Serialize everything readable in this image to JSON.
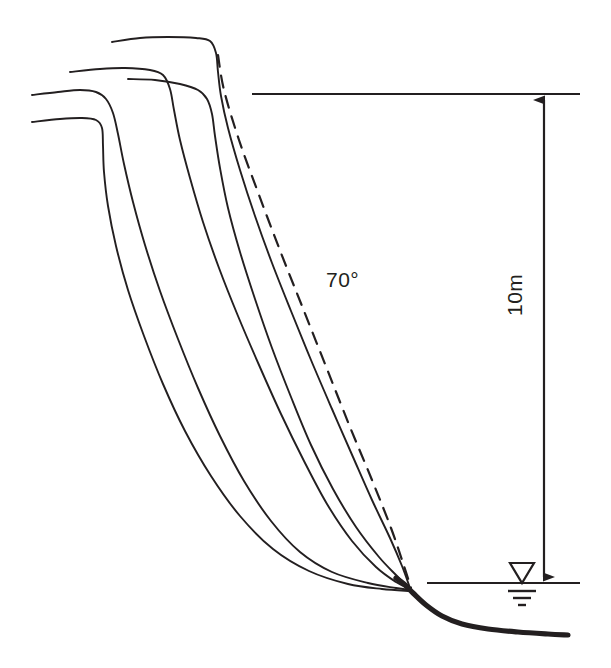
{
  "figure": {
    "background_color": "#ffffff",
    "line_color": "#231f20",
    "width": 611,
    "height": 668
  },
  "annotations": {
    "angle_label": "70°",
    "depth_label": "10m"
  },
  "symbols": {
    "water_table": "water-table-symbol",
    "dimension_arrow": "double-headed-vertical-arrow"
  },
  "chart_data": {
    "type": "line",
    "xlabel": "",
    "ylabel": "",
    "grid": false,
    "legend": "none",
    "annotations": [
      {
        "text": "70°",
        "x": 328,
        "y": 280,
        "role": "slope-angle-of-dashed-reference-line"
      },
      {
        "text": "10m",
        "x": 513,
        "y": 350,
        "role": "vertical-dimension-between-crest-and-water-table",
        "rotation": -90
      }
    ],
    "reference_lines": [
      {
        "name": "crest-level-line",
        "type": "horizontal-solid",
        "y": 94,
        "x_start": 252,
        "x_end": 580
      },
      {
        "name": "water-table-level-line",
        "type": "horizontal-solid",
        "y": 583,
        "x_start": 427,
        "x_end": 580
      },
      {
        "name": "dimension-arrow-10m",
        "type": "vertical-double-arrow",
        "x": 544,
        "y_top": 94,
        "y_bottom": 583
      }
    ],
    "series": [
      {
        "name": "reference-slope-70deg",
        "style": "dashed",
        "points": [
          [
            218,
            55
          ],
          [
            224,
            90
          ],
          [
            239,
            140
          ],
          [
            259,
            195
          ],
          [
            281,
            253
          ],
          [
            304,
            311
          ],
          [
            327,
            369
          ],
          [
            350,
            427
          ],
          [
            372,
            480
          ],
          [
            391,
            528
          ],
          [
            404,
            566
          ],
          [
            411,
            588
          ]
        ]
      },
      {
        "name": "deflection-profile-1",
        "style": "solid",
        "points": [
          [
            112,
            42
          ],
          [
            140,
            38
          ],
          [
            168,
            37
          ],
          [
            196,
            38
          ],
          [
            210,
            41
          ],
          [
            216,
            53
          ],
          [
            218,
            72
          ],
          [
            221,
            96
          ],
          [
            228,
            128
          ],
          [
            240,
            170
          ],
          [
            255,
            216
          ],
          [
            272,
            263
          ],
          [
            291,
            311
          ],
          [
            311,
            360
          ],
          [
            332,
            409
          ],
          [
            353,
            457
          ],
          [
            372,
            500
          ],
          [
            390,
            538
          ],
          [
            402,
            566
          ],
          [
            410,
            588
          ]
        ]
      },
      {
        "name": "deflection-profile-2",
        "style": "solid",
        "points": [
          [
            70,
            72
          ],
          [
            100,
            69
          ],
          [
            125,
            68
          ],
          [
            150,
            70
          ],
          [
            163,
            75
          ],
          [
            170,
            89
          ],
          [
            174,
            110
          ],
          [
            180,
            140
          ],
          [
            190,
            178
          ],
          [
            203,
            222
          ],
          [
            219,
            268
          ],
          [
            238,
            316
          ],
          [
            259,
            365
          ],
          [
            281,
            414
          ],
          [
            304,
            461
          ],
          [
            327,
            504
          ],
          [
            352,
            541
          ],
          [
            376,
            567
          ],
          [
            396,
            582
          ],
          [
            410,
            589
          ]
        ]
      },
      {
        "name": "deflection-profile-3",
        "style": "solid",
        "points": [
          [
            128,
            79
          ],
          [
            155,
            80
          ],
          [
            180,
            84
          ],
          [
            198,
            90
          ],
          [
            207,
            99
          ],
          [
            212,
            114
          ],
          [
            215,
            136
          ],
          [
            220,
            168
          ],
          [
            228,
            208
          ],
          [
            240,
            252
          ],
          [
            255,
            299
          ],
          [
            272,
            348
          ],
          [
            291,
            397
          ],
          [
            311,
            445
          ],
          [
            333,
            489
          ],
          [
            356,
            527
          ],
          [
            379,
            557
          ],
          [
            397,
            576
          ],
          [
            410,
            589
          ]
        ]
      },
      {
        "name": "deflection-profile-4",
        "style": "solid",
        "points": [
          [
            32,
            95
          ],
          [
            58,
            92
          ],
          [
            80,
            90
          ],
          [
            96,
            92
          ],
          [
            106,
            99
          ],
          [
            113,
            113
          ],
          [
            118,
            134
          ],
          [
            124,
            164
          ],
          [
            133,
            202
          ],
          [
            145,
            245
          ],
          [
            160,
            291
          ],
          [
            178,
            339
          ],
          [
            198,
            388
          ],
          [
            220,
            436
          ],
          [
            244,
            481
          ],
          [
            271,
            521
          ],
          [
            300,
            552
          ],
          [
            332,
            572
          ],
          [
            368,
            583
          ],
          [
            396,
            588
          ],
          [
            410,
            590
          ]
        ]
      },
      {
        "name": "deflection-profile-5",
        "style": "solid",
        "points": [
          [
            32,
            122
          ],
          [
            60,
            119
          ],
          [
            82,
            118
          ],
          [
            96,
            120
          ],
          [
            102,
            128
          ],
          [
            103,
            146
          ],
          [
            104,
            172
          ],
          [
            108,
            206
          ],
          [
            116,
            246
          ],
          [
            128,
            290
          ],
          [
            144,
            336
          ],
          [
            163,
            384
          ],
          [
            185,
            431
          ],
          [
            211,
            476
          ],
          [
            240,
            516
          ],
          [
            273,
            549
          ],
          [
            309,
            571
          ],
          [
            348,
            584
          ],
          [
            382,
            589
          ],
          [
            410,
            591
          ]
        ]
      },
      {
        "name": "bedrock-base-thick",
        "style": "solid-bold",
        "points": [
          [
            396,
            578
          ],
          [
            404,
            584
          ],
          [
            413,
            593
          ],
          [
            426,
            605
          ],
          [
            442,
            616
          ],
          [
            462,
            624
          ],
          [
            488,
            629
          ],
          [
            518,
            632
          ],
          [
            548,
            634
          ],
          [
            568,
            635
          ]
        ]
      }
    ]
  }
}
